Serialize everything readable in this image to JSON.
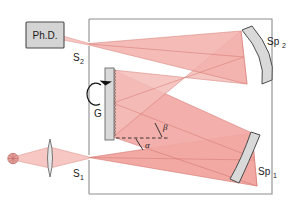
{
  "figure": {
    "background_color": "#ffffff",
    "frame_color": "#8d8d8d",
    "beam_fill": "#f2a9a4",
    "beam_fill_light": "#f8d6d3",
    "beam_stroke": "#d4756e",
    "component_fill": "#d9d9d9",
    "component_stroke": "#6b6b6b",
    "source_color": "#e09a96",
    "label_color": "#1a1a1a"
  },
  "labels": {
    "detector": "Ph.D.",
    "exit_slit": "S",
    "exit_slit_sub": "2",
    "entrance_slit": "S",
    "entrance_slit_sub": "1",
    "grating": "G",
    "mirror_top": "Sp",
    "mirror_top_sub": "2",
    "mirror_bottom": "Sp",
    "mirror_bottom_sub": "1",
    "angle_alpha": "α",
    "angle_beta": "β"
  },
  "components": [
    {
      "name": "photodiode-detector",
      "label": "Ph.D.",
      "type": "box"
    },
    {
      "name": "exit-slit",
      "label": "S2",
      "type": "slit"
    },
    {
      "name": "entrance-slit",
      "label": "S1",
      "type": "slit"
    },
    {
      "name": "diffraction-grating",
      "label": "G",
      "type": "grating"
    },
    {
      "name": "collimating-mirror",
      "label": "Sp2",
      "type": "concave-mirror"
    },
    {
      "name": "focusing-mirror",
      "label": "Sp1",
      "type": "concave-mirror"
    },
    {
      "name": "light-source",
      "label": "",
      "type": "source"
    },
    {
      "name": "condenser-lens",
      "label": "",
      "type": "lens"
    }
  ],
  "annotations": {
    "rotation_arrow": "grating-rotation-arrow",
    "normal_line": "grating-normal-dashed-line",
    "incidence_angle": "α",
    "diffraction_angle": "β"
  }
}
